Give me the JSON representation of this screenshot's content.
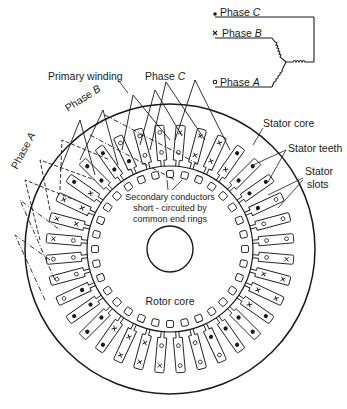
{
  "colors": {
    "ink": "#1a1a1a",
    "background": "#ffffff"
  },
  "legend": {
    "phase_c": {
      "symbol": "dot",
      "label": "Phase",
      "letter": "C"
    },
    "phase_b": {
      "symbol": "cross",
      "label": "Phase",
      "letter": "B"
    },
    "phase_a": {
      "symbol": "circle",
      "label": "Phase",
      "letter": "A"
    }
  },
  "labels": {
    "primary_winding": "Primary winding",
    "phase_c_winding": "Phase",
    "phase_c_letter": "C",
    "phase_b_winding": "Phase",
    "phase_b_letter": "B",
    "phase_a_winding": "Phase",
    "phase_a_letter": "A",
    "stator_core": "Stator core",
    "stator_teeth": "Stator teeth",
    "stator_slots_line1": "Stator",
    "stator_slots_line2": "slots",
    "secondary_line1": "Secondary conductors",
    "secondary_line2": "short - circuited by",
    "secondary_line3": "common end rings",
    "rotor_core": "Rotor core"
  },
  "geometry": {
    "center": [
      170,
      249
    ],
    "stator_outer_radius": 145,
    "slot_outer_radius": 124,
    "air_gap_radius": 83,
    "rotor_slot_radius": 75,
    "shaft_radius": 23,
    "stator_slot_count": 36,
    "rotor_slot_count": 32
  },
  "stator_slots": [
    [
      "o",
      "x"
    ],
    [
      "x",
      "x"
    ],
    [
      "x",
      "x"
    ],
    [
      "x",
      "•"
    ],
    [
      "•",
      "•"
    ],
    [
      "•",
      "•"
    ],
    [
      "•",
      "o"
    ],
    [
      "o",
      "o"
    ],
    [
      "o",
      "o"
    ],
    [
      "o",
      "x"
    ],
    [
      "x",
      "x"
    ],
    [
      "x",
      "x"
    ],
    [
      "x",
      "•"
    ],
    [
      "•",
      "•"
    ],
    [
      "•",
      "•"
    ],
    [
      "•",
      "o"
    ],
    [
      "o",
      "o"
    ],
    [
      "o",
      "o"
    ],
    [
      "o",
      "x"
    ],
    [
      "x",
      "x"
    ],
    [
      "x",
      "x"
    ],
    [
      "x",
      "•"
    ],
    [
      "•",
      "•"
    ],
    [
      "•",
      "•"
    ],
    [
      "•",
      "o"
    ],
    [
      "o",
      "o"
    ],
    [
      "o",
      "o"
    ],
    [
      "o",
      "x"
    ],
    [
      "x",
      "x"
    ],
    [
      "x",
      "x"
    ],
    [
      "x",
      "•"
    ],
    [
      "•",
      "•"
    ],
    [
      "•",
      "•"
    ],
    [
      "•",
      "o"
    ],
    [
      "o",
      "o"
    ],
    [
      "o",
      "o"
    ]
  ]
}
